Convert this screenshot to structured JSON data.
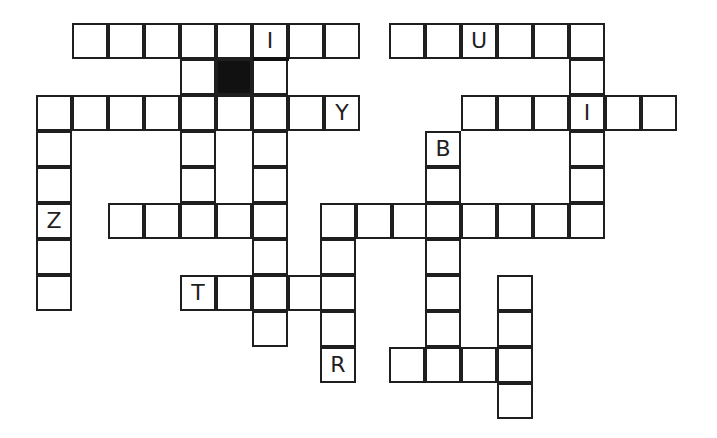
{
  "puzzle": {
    "type": "crossword",
    "cell_size": 36,
    "origin": {
      "x": 37,
      "y": 23
    },
    "colors": {
      "border": "#1f1f1f",
      "block": "#111111",
      "background": "#ffffff",
      "letter": "#1f1f1f"
    },
    "cells": [
      {
        "r": 0,
        "c": 1,
        "v": ""
      },
      {
        "r": 0,
        "c": 2,
        "v": ""
      },
      {
        "r": 0,
        "c": 3,
        "v": ""
      },
      {
        "r": 0,
        "c": 4,
        "v": ""
      },
      {
        "r": 0,
        "c": 5,
        "v": ""
      },
      {
        "r": 0,
        "c": 6,
        "v": "I"
      },
      {
        "r": 0,
        "c": 7,
        "v": ""
      },
      {
        "r": 0,
        "c": 8,
        "v": ""
      },
      {
        "r": 0,
        "c": 9.8,
        "v": ""
      },
      {
        "r": 0,
        "c": 10.8,
        "v": ""
      },
      {
        "r": 0,
        "c": 11.8,
        "v": "U"
      },
      {
        "r": 0,
        "c": 12.8,
        "v": ""
      },
      {
        "r": 0,
        "c": 13.8,
        "v": ""
      },
      {
        "r": 0,
        "c": 14.8,
        "v": ""
      },
      {
        "r": 1,
        "c": 4,
        "v": ""
      },
      {
        "r": 1,
        "c": 5,
        "v": "",
        "block": true
      },
      {
        "r": 1,
        "c": 6,
        "v": ""
      },
      {
        "r": 1,
        "c": 14.8,
        "v": ""
      },
      {
        "r": 2,
        "c": 0,
        "v": ""
      },
      {
        "r": 2,
        "c": 1,
        "v": ""
      },
      {
        "r": 2,
        "c": 2,
        "v": ""
      },
      {
        "r": 2,
        "c": 3,
        "v": ""
      },
      {
        "r": 2,
        "c": 4,
        "v": ""
      },
      {
        "r": 2,
        "c": 5,
        "v": ""
      },
      {
        "r": 2,
        "c": 6,
        "v": ""
      },
      {
        "r": 2,
        "c": 7,
        "v": ""
      },
      {
        "r": 2,
        "c": 8,
        "v": "Y"
      },
      {
        "r": 2,
        "c": 11.8,
        "v": ""
      },
      {
        "r": 2,
        "c": 12.8,
        "v": ""
      },
      {
        "r": 2,
        "c": 13.8,
        "v": ""
      },
      {
        "r": 2,
        "c": 14.8,
        "v": "I"
      },
      {
        "r": 2,
        "c": 15.8,
        "v": ""
      },
      {
        "r": 2,
        "c": 16.8,
        "v": ""
      },
      {
        "r": 3,
        "c": 0,
        "v": ""
      },
      {
        "r": 3,
        "c": 4,
        "v": ""
      },
      {
        "r": 3,
        "c": 6,
        "v": ""
      },
      {
        "r": 3,
        "c": 10.8,
        "v": "B"
      },
      {
        "r": 3,
        "c": 14.8,
        "v": ""
      },
      {
        "r": 4,
        "c": 0,
        "v": ""
      },
      {
        "r": 4,
        "c": 4,
        "v": ""
      },
      {
        "r": 4,
        "c": 6,
        "v": ""
      },
      {
        "r": 4,
        "c": 10.8,
        "v": ""
      },
      {
        "r": 4,
        "c": 14.8,
        "v": ""
      },
      {
        "r": 5,
        "c": 0,
        "v": "Z"
      },
      {
        "r": 5,
        "c": 2,
        "v": ""
      },
      {
        "r": 5,
        "c": 3,
        "v": ""
      },
      {
        "r": 5,
        "c": 4,
        "v": ""
      },
      {
        "r": 5,
        "c": 5,
        "v": ""
      },
      {
        "r": 5,
        "c": 6,
        "v": ""
      },
      {
        "r": 5,
        "c": 7.9,
        "v": ""
      },
      {
        "r": 5,
        "c": 8.9,
        "v": ""
      },
      {
        "r": 5,
        "c": 9.9,
        "v": ""
      },
      {
        "r": 5,
        "c": 10.8,
        "v": ""
      },
      {
        "r": 5,
        "c": 11.8,
        "v": ""
      },
      {
        "r": 5,
        "c": 12.8,
        "v": ""
      },
      {
        "r": 5,
        "c": 13.8,
        "v": ""
      },
      {
        "r": 5,
        "c": 14.8,
        "v": ""
      },
      {
        "r": 6,
        "c": 0,
        "v": ""
      },
      {
        "r": 6,
        "c": 6,
        "v": ""
      },
      {
        "r": 6,
        "c": 7.9,
        "v": ""
      },
      {
        "r": 6,
        "c": 10.8,
        "v": ""
      },
      {
        "r": 7,
        "c": 0,
        "v": ""
      },
      {
        "r": 7,
        "c": 4,
        "v": "T"
      },
      {
        "r": 7,
        "c": 5,
        "v": ""
      },
      {
        "r": 7,
        "c": 6,
        "v": ""
      },
      {
        "r": 7,
        "c": 7,
        "v": ""
      },
      {
        "r": 7,
        "c": 7.9,
        "v": ""
      },
      {
        "r": 7,
        "c": 10.8,
        "v": ""
      },
      {
        "r": 7,
        "c": 12.8,
        "v": ""
      },
      {
        "r": 8,
        "c": 6,
        "v": ""
      },
      {
        "r": 8,
        "c": 7.9,
        "v": ""
      },
      {
        "r": 8,
        "c": 10.8,
        "v": ""
      },
      {
        "r": 8,
        "c": 12.8,
        "v": ""
      },
      {
        "r": 9,
        "c": 7.9,
        "v": "R"
      },
      {
        "r": 9,
        "c": 9.8,
        "v": ""
      },
      {
        "r": 9,
        "c": 10.8,
        "v": ""
      },
      {
        "r": 9,
        "c": 11.8,
        "v": ""
      },
      {
        "r": 9,
        "c": 12.8,
        "v": ""
      },
      {
        "r": 10,
        "c": 12.8,
        "v": ""
      }
    ],
    "bars": [
      {
        "x": 253,
        "y": 57,
        "w": 36
      }
    ],
    "given_letters": [
      "I",
      "U",
      "Y",
      "I",
      "B",
      "Z",
      "T",
      "R"
    ]
  }
}
